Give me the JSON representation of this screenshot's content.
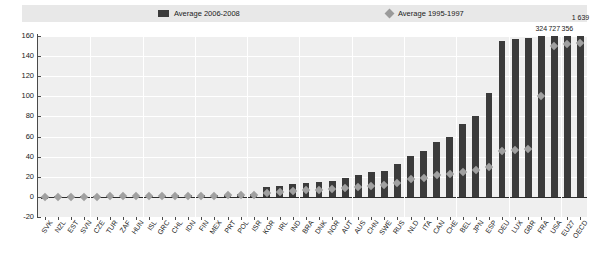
{
  "legend": {
    "entries": [
      {
        "label": "Average 2006-2008",
        "marker": "square-swatch-icon",
        "color": "#3b3b3b"
      },
      {
        "label": "Average 1995-1997",
        "marker": "diamond-swatch-icon",
        "color": "#9a9a9a"
      }
    ]
  },
  "axes": {
    "y_ticks": [
      "-20",
      "0",
      "20",
      "40",
      "60",
      "80",
      "100",
      "120",
      "140",
      "160"
    ],
    "y_min": -20,
    "y_max": 160,
    "y_step": 20,
    "grid": true
  },
  "annotations": {
    "top_labels": [
      {
        "category": "FRA",
        "text": "324"
      },
      {
        "category": "USA",
        "text": "727"
      },
      {
        "category": "EU27",
        "text": "356"
      },
      {
        "category": "OECD",
        "text": "1 639"
      }
    ]
  },
  "chart_data": {
    "type": "bar",
    "title": "",
    "subtitle": "",
    "xlabel": "",
    "ylabel": "",
    "ylim": [
      -20,
      160
    ],
    "grid": true,
    "legend_position": "top",
    "categories": [
      "SVK",
      "NZL",
      "EST",
      "SVN",
      "CZE",
      "TUR",
      "ZAF",
      "HUN",
      "ISL",
      "GRC",
      "CHL",
      "IDN",
      "FIN",
      "MEX",
      "PRT",
      "POL",
      "ISR",
      "KOR",
      "IRL",
      "IND",
      "BRA",
      "DNK",
      "NOR",
      "AUT",
      "AUS",
      "CHN",
      "SWE",
      "RUS",
      "NLD",
      "ITA",
      "CAN",
      "CHE",
      "BEL",
      "JPN",
      "ESP",
      "DEU",
      "LUX",
      "GBR",
      "FRA",
      "USA",
      "EU27",
      "OECD"
    ],
    "series": [
      {
        "name": "Average 2006-2008",
        "type": "bar",
        "color": "#3b3b3b",
        "values": [
          0.3,
          0.4,
          0.4,
          0.5,
          0.6,
          0.7,
          0.8,
          1.0,
          1.1,
          1.2,
          1.4,
          1.6,
          1.8,
          2.0,
          2.3,
          2.6,
          3.0,
          10.0,
          11.0,
          12.5,
          13.5,
          14.5,
          16.0,
          19.0,
          22.0,
          25.0,
          26.0,
          33.0,
          41.0,
          46.0,
          55.0,
          60.0,
          72.0,
          80.0,
          103.0,
          155.0,
          157.0,
          158.0,
          324.0,
          727.0,
          356.0,
          1639.0
        ],
        "clipped_above": 160
      },
      {
        "name": "Average 1995-1997",
        "type": "scatter",
        "color": "#a0a0a0",
        "values": [
          0.2,
          0.2,
          0.2,
          0.3,
          0.3,
          0.4,
          0.4,
          0.5,
          0.6,
          0.7,
          0.8,
          0.9,
          1.1,
          1.3,
          1.5,
          1.7,
          2.0,
          4.0,
          5.0,
          6.0,
          6.5,
          7.0,
          8.0,
          9.0,
          10.0,
          11.0,
          12.0,
          13.5,
          18.0,
          19.0,
          22.0,
          23.0,
          25.0,
          27.0,
          30.0,
          46.0,
          47.0,
          48.0,
          100.0,
          150.0,
          152.0,
          153.0
        ]
      }
    ]
  }
}
